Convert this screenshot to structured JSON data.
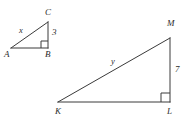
{
  "figure": {
    "stroke_color": "#3a3a3a",
    "text_color": "#2b2b2b",
    "background_color": "#ffffff",
    "stroke_width": 1
  },
  "triangles": [
    {
      "name": "triangle-abc",
      "vertices": [
        {
          "label": "A",
          "x": 11,
          "y": 48,
          "label_x": 4,
          "label_y": 50
        },
        {
          "label": "B",
          "x": 48,
          "y": 48,
          "label_x": 45,
          "label_y": 50
        },
        {
          "label": "C",
          "x": 48,
          "y": 22,
          "label_x": 45,
          "label_y": 8
        }
      ],
      "right_angle_vertex": "B",
      "sides": [
        {
          "name": "hypotenuse-ac",
          "label": "x",
          "label_x": 19,
          "label_y": 26
        },
        {
          "name": "leg-bc",
          "label": "3",
          "label_x": 52,
          "label_y": 28
        }
      ]
    },
    {
      "name": "triangle-klm",
      "vertices": [
        {
          "label": "K",
          "x": 58,
          "y": 102,
          "label_x": 55,
          "label_y": 107
        },
        {
          "label": "L",
          "x": 170,
          "y": 102,
          "label_x": 167,
          "label_y": 107
        },
        {
          "label": "M",
          "x": 170,
          "y": 38,
          "label_x": 167,
          "label_y": 19
        }
      ],
      "right_angle_vertex": "L",
      "sides": [
        {
          "name": "hypotenuse-km",
          "label": "y",
          "label_x": 111,
          "label_y": 57
        },
        {
          "name": "leg-lm",
          "label": "7",
          "label_x": 175,
          "label_y": 65
        }
      ]
    }
  ]
}
